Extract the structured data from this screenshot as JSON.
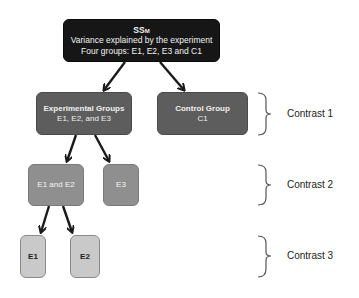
{
  "diagram": {
    "root": {
      "title": "SS",
      "title_subscript": "M",
      "line1": "Variance explained by the experiment",
      "line2": "Four groups: E1, E2, E3 and C1"
    },
    "level1": {
      "experimental": {
        "title": "Experimental Groups",
        "subtitle": "E1, E2, and E3"
      },
      "control": {
        "title": "Control Group",
        "subtitle": "C1"
      }
    },
    "level2": {
      "e1e2": {
        "title": "E1 and E2"
      },
      "e3": {
        "title": "E3"
      }
    },
    "level3": {
      "e1": {
        "title": "E1"
      },
      "e2": {
        "title": "E2"
      }
    },
    "contrasts": [
      {
        "label": "Contrast 1"
      },
      {
        "label": "Contrast 2"
      },
      {
        "label": "Contrast 3"
      }
    ],
    "colors": {
      "root": "#161616",
      "level1": "#5d5d5d",
      "level2": "#8f8f8f",
      "level3": "#c9c9c9",
      "arrow": "#1a1a1a"
    }
  }
}
